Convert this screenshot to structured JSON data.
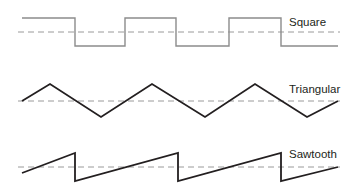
{
  "figure": {
    "background_color": "#ffffff",
    "width": 360,
    "height": 196
  },
  "waveforms": [
    {
      "name": "square",
      "label": "Square",
      "label_x": 289,
      "label_y": 26,
      "stroke_color": "#8c8c8c",
      "stroke_width": 1.4,
      "midline_color": "#9a9a9a",
      "midline_y": 32,
      "midline_x1": 18,
      "midline_x2": 340,
      "high_y": 18,
      "low_y": 46,
      "points": "22,18 75,18 75,46 125,46 125,18 176,18 176,46 229,46 229,18 281,18 281,46 338,46"
    },
    {
      "name": "triangular",
      "label": "Triangular",
      "label_x": 289,
      "label_y": 93,
      "stroke_color": "#231f20",
      "stroke_width": 1.8,
      "midline_color": "#9a9a9a",
      "midline_y": 101,
      "midline_x1": 18,
      "midline_x2": 340,
      "peak_y": 84,
      "trough_y": 117,
      "points": "22,101 50,84 101,117 152,84 205,117 255,84 307,117 338,101"
    },
    {
      "name": "sawtooth",
      "label": "Sawtooth",
      "label_x": 289,
      "label_y": 158,
      "stroke_color": "#231f20",
      "stroke_width": 1.8,
      "midline_color": "#9a9a9a",
      "midline_y": 167,
      "midline_x1": 18,
      "midline_x2": 340,
      "peak_y": 153,
      "trough_y": 181,
      "points": "22,173 75,153 75,181 178,153 178,181 281,153 281,181 338,167"
    }
  ],
  "chart_data": {
    "type": "line",
    "title": "",
    "xlabel": "",
    "ylabel": "",
    "grid": false,
    "legend_position": "right-inline",
    "series": [
      {
        "name": "Square",
        "waveform": "square",
        "amplitude_levels": [
          "high",
          "low"
        ],
        "cycles": 3,
        "description": "Periodic square wave alternating between a constant high level and a constant low level with instantaneous vertical transitions, starting high."
      },
      {
        "name": "Triangular",
        "waveform": "triangular",
        "amplitude_levels": [
          "peak",
          "trough"
        ],
        "cycles": 3,
        "description": "Periodic triangle wave rising and falling linearly with equal slopes between peaks and troughs, starting at the midline rising."
      },
      {
        "name": "Sawtooth",
        "waveform": "sawtooth",
        "amplitude_levels": [
          "peak",
          "trough"
        ],
        "cycles": 3,
        "description": "Periodic sawtooth wave ramping up linearly then dropping vertically back to the minimum."
      }
    ]
  }
}
